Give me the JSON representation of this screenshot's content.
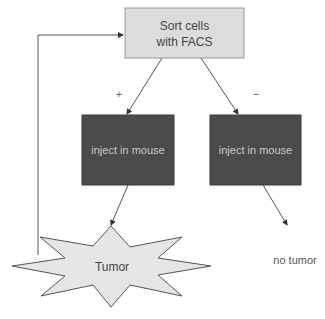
{
  "diagram": {
    "nodes": {
      "sort": {
        "line1": "Sort cells",
        "line2": "with FACS"
      },
      "inject_left": {
        "label": "inject in mouse"
      },
      "inject_right": {
        "label": "inject in mouse"
      },
      "tumor": {
        "label": "Tumor"
      },
      "no_tumor": {
        "label": "no tumor"
      }
    },
    "edge_labels": {
      "positive": "+",
      "negative": "−"
    },
    "colors": {
      "sort_fill": "#dcdcdc",
      "inject_fill": "#4b4b4b",
      "inject_text": "#c8c8c8",
      "tumor_fill": "#e6e6e6",
      "line": "#555555",
      "text": "#444444"
    }
  }
}
